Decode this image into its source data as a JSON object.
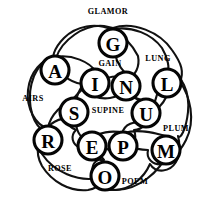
{
  "diagram": {
    "title": "GLAMOR",
    "type": "overlapping-word-loop-rosette",
    "background_color": "#ffffff",
    "stroke_color": "#111111",
    "node_fill_color": "#ffffff",
    "node_stroke_color": "#050505",
    "text_color": "#000000",
    "nodes": [
      {
        "id": "n-g",
        "letter": "G",
        "cx": 113,
        "cy": 43,
        "r": 15
      },
      {
        "id": "n-a",
        "letter": "A",
        "cx": 55,
        "cy": 70,
        "r": 15
      },
      {
        "id": "n-i",
        "letter": "I",
        "cx": 95,
        "cy": 83,
        "r": 15
      },
      {
        "id": "n-n",
        "letter": "N",
        "cx": 126,
        "cy": 86,
        "r": 15
      },
      {
        "id": "n-l",
        "letter": "L",
        "cx": 167,
        "cy": 83,
        "r": 15
      },
      {
        "id": "n-s",
        "letter": "S",
        "cx": 74,
        "cy": 112,
        "r": 15
      },
      {
        "id": "n-u",
        "letter": "U",
        "cx": 146,
        "cy": 113,
        "r": 15
      },
      {
        "id": "n-r",
        "letter": "R",
        "cx": 48,
        "cy": 140,
        "r": 15
      },
      {
        "id": "n-e",
        "letter": "E",
        "cx": 92,
        "cy": 146,
        "r": 15
      },
      {
        "id": "n-p",
        "letter": "P",
        "cx": 123,
        "cy": 146,
        "r": 15
      },
      {
        "id": "n-m",
        "letter": "M",
        "cx": 166,
        "cy": 150,
        "r": 15
      },
      {
        "id": "n-o",
        "letter": "O",
        "cx": 105,
        "cy": 176,
        "r": 15
      }
    ],
    "words": [
      {
        "id": "w-glamor",
        "text": "GLAMOR",
        "letters": [
          "G",
          "L",
          "A",
          "M",
          "O",
          "R"
        ],
        "label_x": 108,
        "label_y": 11,
        "position": "top-outer"
      },
      {
        "id": "w-lung",
        "text": "LUNG",
        "letters": [
          "L",
          "U",
          "N",
          "G"
        ],
        "label_x": 158,
        "label_y": 58,
        "position": "upper-right"
      },
      {
        "id": "w-airs",
        "text": "AIRS",
        "letters": [
          "A",
          "I",
          "R",
          "S"
        ],
        "label_x": 33,
        "label_y": 98,
        "position": "left"
      },
      {
        "id": "w-plum",
        "text": "PLUM",
        "letters": [
          "P",
          "L",
          "U",
          "M"
        ],
        "label_x": 176,
        "label_y": 128,
        "position": "lower-right"
      },
      {
        "id": "w-rose",
        "text": "ROSE",
        "letters": [
          "R",
          "O",
          "S",
          "E"
        ],
        "label_x": 60,
        "label_y": 168,
        "position": "lower-left"
      },
      {
        "id": "w-poem",
        "text": "POEM",
        "letters": [
          "P",
          "O",
          "E",
          "M"
        ],
        "label_x": 135,
        "label_y": 181,
        "position": "bottom"
      },
      {
        "id": "w-gain",
        "text": "GAIN",
        "letters": [
          "G",
          "A",
          "I",
          "N"
        ],
        "label_x": 110,
        "label_y": 63,
        "position": "inner-top"
      },
      {
        "id": "w-supine",
        "text": "SUPINE",
        "letters": [
          "S",
          "U",
          "P",
          "I",
          "N",
          "E"
        ],
        "label_x": 108,
        "label_y": 110,
        "position": "inner-center"
      }
    ]
  }
}
